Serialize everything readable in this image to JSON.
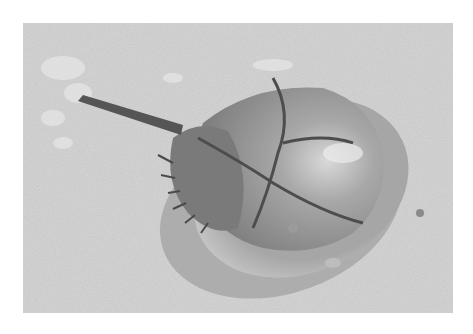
{
  "image": {
    "subject": "Horseshoe crab on sandy beach",
    "style": "grayscale photograph",
    "colors": {
      "border": "#ffffff",
      "sand": "#c8c8c8",
      "shell": "#8f8f8f",
      "shell_highlight": "#d8d8d8",
      "shadow": "#6f6f6f"
    }
  }
}
